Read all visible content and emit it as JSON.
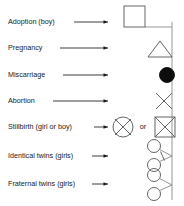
{
  "legend": {
    "title": "Pedigree symbol legend",
    "or_text": "or",
    "colors": {
      "symbol_stroke": "#555555",
      "symbol_fill_dark": "#0d0d0d",
      "arrow": "#1a1a1a",
      "family_line": "#8a8a8a",
      "text": "#1a1a1a",
      "background": "#ffffff"
    },
    "rows": [
      {
        "id": "adoption-boy",
        "label": "Adoption (boy)",
        "symbol": "square-bracketed",
        "symbol_name": "square-symbol",
        "meaning": "Adoption (boy)"
      },
      {
        "id": "pregnancy",
        "label": "Pregnancy",
        "symbol": "triangle",
        "symbol_name": "triangle-symbol",
        "meaning": "Pregnancy"
      },
      {
        "id": "miscarriage",
        "label": "Miscarriage",
        "symbol": "filled-circle",
        "symbol_name": "filled-circle-symbol",
        "meaning": "Miscarriage"
      },
      {
        "id": "abortion",
        "label": "Abortion",
        "symbol": "x-cross",
        "symbol_name": "x-cross-symbol",
        "meaning": "Abortion"
      },
      {
        "id": "stillbirth",
        "label": "Stillbirth (girl or boy)",
        "symbol": "circle-with-x or square-with-x",
        "symbol_name": "stillbirth-symbols",
        "meaning": "Stillbirth (girl or boy)"
      },
      {
        "id": "identical-twins",
        "label": "Identical twins (girls)",
        "symbol": "two-circles-with-crossbar",
        "symbol_name": "identical-twins-symbol",
        "meaning": "Identical twins (girls)"
      },
      {
        "id": "fraternal-twins",
        "label": "Fraternal twins (girls)",
        "symbol": "two-circles-v-shape",
        "symbol_name": "fraternal-twins-symbol",
        "meaning": "Fraternal twins (girls)"
      }
    ]
  }
}
